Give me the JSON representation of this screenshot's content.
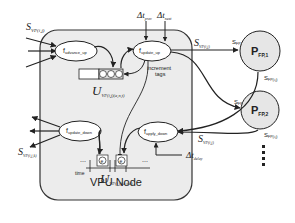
{
  "node": {
    "title": "VPU Node"
  },
  "functions": {
    "advance_up": {
      "main": "f",
      "sub": "advance_up"
    },
    "update_up": {
      "main": "f",
      "sub": "update_up"
    },
    "update_down": {
      "main": "f",
      "sub": "update_down"
    },
    "apply_down": {
      "main": "f",
      "sub": "apply_down"
    }
  },
  "labels": {
    "s_in_top": {
      "main": "S",
      "sub": "VP(i,j)"
    },
    "s_out_left": {
      "main": "S",
      "sub": "VP(i,j,k)"
    },
    "s_out_up": {
      "main": "S",
      "sub": "VP(i,j)"
    },
    "s_in_right": {
      "main": "S",
      "sub": "VP(i,j)"
    },
    "dt_prev": {
      "main": "Δt",
      "sub": "prev"
    },
    "dt_next": {
      "main": "Δt",
      "sub": "next"
    },
    "dt_delay": {
      "main": "Δt",
      "sub": "delay"
    },
    "increment_tags": "increment tags",
    "time": "time",
    "u_up": {
      "main": "U",
      "sub": "VP(i,j)(a,n,t)"
    },
    "u_down": {
      "main": "U",
      "sub": "VP(i,j)(a,t,d)"
    },
    "buffer_tag": "e",
    "ellipsis": "...",
    "s_fp1_in": {
      "main": "S",
      "sub": "FP,1"
    },
    "s_fp1_out": {
      "main": "S",
      "sub": "FP(i,j)"
    },
    "s_fp2_in": {
      "main": "S",
      "sub": "FP,2"
    },
    "s_fp2_out": {
      "main": "S",
      "sub": "FP(i,j)"
    }
  },
  "processors": [
    {
      "main": "P",
      "sub": "FP,1"
    },
    {
      "main": "P",
      "sub": "FP,2"
    }
  ],
  "colors": {
    "node_fill": "#ececec",
    "node_stroke": "#333333",
    "proc_fill": "#e6e6e6",
    "line": "#222222"
  }
}
